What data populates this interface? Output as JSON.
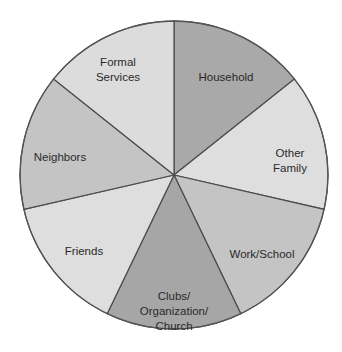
{
  "chart_data": {
    "type": "pie",
    "title": "",
    "start_angle_deg": 0,
    "direction": "clockwise",
    "categories": [
      "Household",
      "Other Family",
      "Work/School",
      "Clubs/Organization/Church",
      "Friends",
      "Neighbors",
      "Formal Services"
    ],
    "values": [
      1,
      1,
      1,
      1,
      1,
      1,
      1
    ],
    "slices": [
      {
        "label": "Household",
        "lines": [
          "Household"
        ],
        "value": 1,
        "color": "#a9a9a9"
      },
      {
        "label": "Other Family",
        "lines": [
          "Other",
          "Family"
        ],
        "value": 1,
        "color": "#dedede"
      },
      {
        "label": "Work/School",
        "lines": [
          "Work/School"
        ],
        "value": 1,
        "color": "#c4c4c4"
      },
      {
        "label": "Clubs/Organization/Church",
        "lines": [
          "Clubs/",
          "Organization/",
          "Church"
        ],
        "value": 1,
        "color": "#a6a6a6"
      },
      {
        "label": "Friends",
        "lines": [
          "Friends"
        ],
        "value": 1,
        "color": "#dedede"
      },
      {
        "label": "Neighbors",
        "lines": [
          "Neighbors"
        ],
        "value": 1,
        "color": "#c4c4c4"
      },
      {
        "label": "Formal Services",
        "lines": [
          "Formal",
          "Services"
        ],
        "value": 1,
        "color": "#dcdcdc"
      }
    ],
    "legend": "none",
    "grid": false
  }
}
